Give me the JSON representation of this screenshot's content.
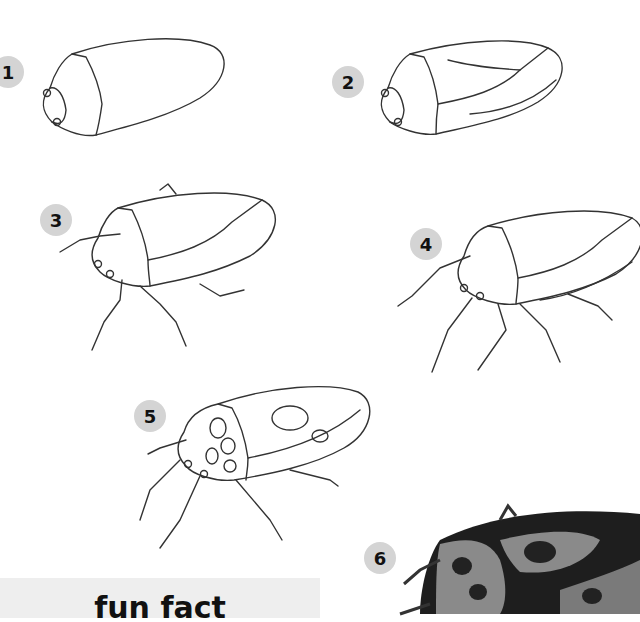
{
  "steps": [
    {
      "number": "1",
      "description": "basic oval body outline with head"
    },
    {
      "number": "2",
      "description": "add wing divisions and abdomen edge"
    },
    {
      "number": "3",
      "description": "add legs and antennae"
    },
    {
      "number": "4",
      "description": "refine legs and abdomen segments"
    },
    {
      "number": "5",
      "description": "add spot patterns"
    },
    {
      "number": "6",
      "description": "final shaded bug"
    }
  ],
  "fun_fact": {
    "title": "fun fact"
  },
  "colors": {
    "badge": "#d4d4d4",
    "line": "#333333",
    "funbox": "#eeeeee",
    "bug_dark": "#1e1e1e",
    "bug_light": "#8a8a8a"
  }
}
